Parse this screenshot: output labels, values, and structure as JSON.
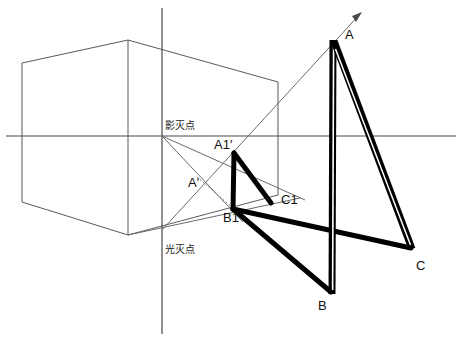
{
  "figure": {
    "background_color": "#ffffff",
    "line_color_thin": "#5a5a5a",
    "line_color_bold": "#000000",
    "label_color": "#101010"
  },
  "labels": {
    "shadow_vanishing_point": "影灭点",
    "light_vanishing_point": "光灭点",
    "point_a": "A",
    "point_b": "B",
    "point_c": "C",
    "point_a1_prime": "A1′",
    "point_a_prime": "A′",
    "point_b1": "B1",
    "point_c1": "C1"
  },
  "label_positions": {
    "shadow_vanishing_point": {
      "x": 165,
      "y": 121
    },
    "light_vanishing_point": {
      "x": 165,
      "y": 245
    },
    "point_a": {
      "x": 345,
      "y": 28
    },
    "point_b": {
      "x": 318,
      "y": 299
    },
    "point_c": {
      "x": 416,
      "y": 259
    },
    "point_a1_prime": {
      "x": 214,
      "y": 138
    },
    "point_a_prime": {
      "x": 188,
      "y": 176
    },
    "point_b1": {
      "x": 223,
      "y": 211
    },
    "point_c1": {
      "x": 281,
      "y": 193
    }
  },
  "geometry": {
    "horizon_line": {
      "x1": 6,
      "y1": 136,
      "x2": 456,
      "y2": 136
    },
    "vertical_axis": {
      "x1": 162,
      "y1": 8,
      "x2": 162,
      "y2": 334
    },
    "shadow_vanishing_point": {
      "x": 162,
      "y": 136
    },
    "light_vanishing_point": {
      "x": 162,
      "y": 230
    },
    "box": {
      "top_back_left": {
        "x": 22,
        "y": 63
      },
      "top_apex": {
        "x": 128,
        "y": 40
      },
      "top_right": {
        "x": 278,
        "y": 82
      },
      "bottom_back_left": {
        "x": 22,
        "y": 202
      },
      "bottom_apex": {
        "x": 128,
        "y": 235
      },
      "bottom_right": {
        "x": 278,
        "y": 195
      },
      "edge_mid_top": {
        "x": 128,
        "y": 40
      },
      "edge_mid_bottom": {
        "x": 128,
        "y": 235
      }
    },
    "bold_figure": {
      "A": {
        "x": 333,
        "y": 40
      },
      "B": {
        "x": 332,
        "y": 292
      },
      "C": {
        "x": 412,
        "y": 247
      },
      "A1p": {
        "x": 233,
        "y": 152
      },
      "B1": {
        "x": 233,
        "y": 210
      },
      "C1": {
        "x": 272,
        "y": 203
      }
    },
    "rays": [
      {
        "name": "light-ray-to-A",
        "from": {
          "x": 162,
          "y": 230
        },
        "to": {
          "x": 362,
          "y": 12
        }
      },
      {
        "name": "shadow-ray-to-B1",
        "from": {
          "x": 162,
          "y": 136
        },
        "to": {
          "x": 240,
          "y": 218
        }
      },
      {
        "name": "shadow-ray-lower",
        "from": {
          "x": 162,
          "y": 136
        },
        "to": {
          "x": 300,
          "y": 198
        }
      },
      {
        "name": "dotted-ray-Aprime-B1",
        "from": {
          "x": 198,
          "y": 178
        },
        "to": {
          "x": 233,
          "y": 210
        }
      }
    ],
    "arrow_tip": {
      "x": 362,
      "y": 12
    }
  }
}
